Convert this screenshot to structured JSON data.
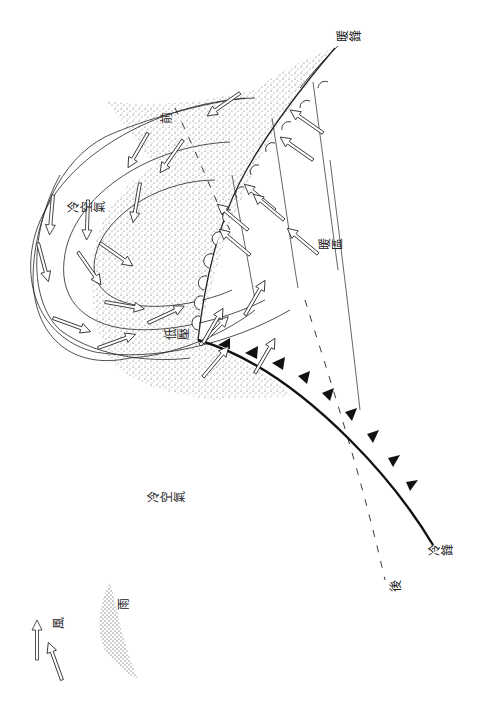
{
  "diagram": {
    "orientation": "rotated 90° counter-clockwise",
    "labels": {
      "warm_front": "暖鋒",
      "cold_front": "冷鋒",
      "warm_sector": "暖區",
      "low_pressure": "低壓",
      "cold_air_upper": "冷空氣",
      "cold_air_lower": "冷空氣",
      "front_ahead": "前",
      "rear": "後"
    },
    "legend": {
      "wind_label": "風",
      "rain_label": "雨"
    },
    "colors": {
      "line": "#222222",
      "rain_stipple": "#333333",
      "background": "#ffffff"
    }
  }
}
